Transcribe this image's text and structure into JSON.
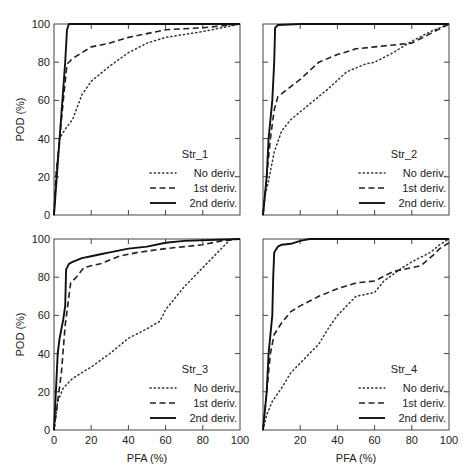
{
  "figure": {
    "ylabel": "POD (%)",
    "xlabel": "PFA (%)",
    "tick_labels": [
      "0",
      "20",
      "40",
      "60",
      "80",
      "100"
    ]
  },
  "legend": {
    "entries": [
      {
        "label": "No deriv.",
        "style": "dotted"
      },
      {
        "label": "1st deriv.",
        "style": "dashed"
      },
      {
        "label": "2nd deriv.",
        "style": "solid"
      }
    ]
  },
  "chart_data": [
    {
      "type": "line",
      "title": "Str_1",
      "xlabel": "",
      "ylabel": "POD (%)",
      "xlim": [
        0,
        100
      ],
      "ylim": [
        0,
        100
      ],
      "grid": false,
      "legend_position": "lower right",
      "series": [
        {
          "name": "No deriv.",
          "style": "dotted",
          "x": [
            0,
            1,
            3,
            6,
            10,
            15,
            20,
            30,
            40,
            50,
            60,
            80,
            100
          ],
          "y": [
            0,
            20,
            40,
            45,
            50,
            63,
            70,
            78,
            85,
            90,
            93,
            96,
            100
          ]
        },
        {
          "name": "1st deriv.",
          "style": "dashed",
          "x": [
            0,
            1,
            3,
            5,
            7,
            10,
            15,
            20,
            30,
            40,
            50,
            60,
            80,
            100
          ],
          "y": [
            0,
            20,
            40,
            60,
            79,
            82,
            85,
            88,
            90,
            93,
            95,
            97,
            98,
            100
          ]
        },
        {
          "name": "2nd deriv.",
          "style": "solid",
          "x": [
            0,
            6,
            7,
            8,
            100
          ],
          "y": [
            0,
            80,
            97,
            100,
            100
          ]
        }
      ]
    },
    {
      "type": "line",
      "title": "Str_2",
      "xlabel": "",
      "ylabel": "",
      "xlim": [
        0,
        100
      ],
      "ylim": [
        0,
        100
      ],
      "grid": false,
      "legend_position": "lower right",
      "series": [
        {
          "name": "No deriv.",
          "style": "dotted",
          "x": [
            0,
            1,
            3,
            6,
            10,
            15,
            25,
            35,
            45,
            55,
            60,
            70,
            75,
            80,
            90,
            100
          ],
          "y": [
            0,
            10,
            18,
            33,
            44,
            50,
            58,
            66,
            75,
            79,
            80,
            85,
            88,
            91,
            96,
            100
          ]
        },
        {
          "name": "1st deriv.",
          "style": "dashed",
          "x": [
            0,
            2,
            4,
            6,
            8,
            12,
            20,
            30,
            40,
            50,
            60,
            80,
            90,
            100
          ],
          "y": [
            0,
            20,
            40,
            55,
            62,
            65,
            71,
            80,
            84,
            87,
            88,
            90,
            95,
            100
          ]
        },
        {
          "name": "2nd deriv.",
          "style": "solid",
          "x": [
            0,
            2,
            3,
            5,
            6,
            6.5,
            8,
            20,
            100
          ],
          "y": [
            0,
            20,
            40,
            60,
            80,
            98,
            99.5,
            100,
            100
          ]
        }
      ]
    },
    {
      "type": "line",
      "title": "Str_3",
      "xlabel": "PFA (%)",
      "ylabel": "POD (%)",
      "xlim": [
        0,
        100
      ],
      "ylim": [
        0,
        100
      ],
      "grid": false,
      "legend_position": "lower right",
      "series": [
        {
          "name": "No deriv.",
          "style": "dotted",
          "x": [
            0,
            2,
            5,
            10,
            20,
            30,
            40,
            50,
            57,
            60,
            70,
            80,
            90,
            95,
            100
          ],
          "y": [
            0,
            15,
            22,
            27,
            33,
            40,
            48,
            53,
            57,
            63,
            75,
            85,
            95,
            100,
            100
          ]
        },
        {
          "name": "1st deriv.",
          "style": "dashed",
          "x": [
            0,
            2,
            4,
            6,
            7,
            8,
            9,
            12,
            16,
            20,
            25,
            35,
            45,
            60,
            80,
            90,
            100
          ],
          "y": [
            0,
            15,
            30,
            55,
            62,
            70,
            77,
            80,
            85,
            86,
            87,
            91,
            93,
            95,
            97,
            99,
            100
          ]
        },
        {
          "name": "2nd deriv.",
          "style": "solid",
          "x": [
            0,
            1,
            2,
            3,
            5,
            6,
            6.5,
            8,
            10,
            15,
            20,
            25,
            30,
            40,
            50,
            60,
            70,
            100
          ],
          "y": [
            0,
            20,
            40,
            48,
            58,
            65,
            84,
            87,
            88,
            90,
            91,
            92,
            93,
            95,
            96,
            98,
            99,
            100
          ]
        }
      ]
    },
    {
      "type": "line",
      "title": "Str_4",
      "xlabel": "PFA (%)",
      "ylabel": "",
      "xlim": [
        0,
        100
      ],
      "ylim": [
        0,
        100
      ],
      "grid": false,
      "legend_position": "lower right",
      "series": [
        {
          "name": "No deriv.",
          "style": "dotted",
          "x": [
            0,
            2,
            5,
            10,
            15,
            20,
            30,
            35,
            40,
            50,
            60,
            65,
            75,
            80,
            90,
            95,
            100
          ],
          "y": [
            0,
            8,
            15,
            22,
            30,
            35,
            45,
            53,
            60,
            70,
            72,
            78,
            85,
            88,
            93,
            97,
            100
          ]
        },
        {
          "name": "1st deriv.",
          "style": "dashed",
          "x": [
            0,
            2,
            4,
            6,
            10,
            15,
            20,
            30,
            40,
            50,
            60,
            70,
            80,
            85,
            92,
            95,
            100
          ],
          "y": [
            0,
            20,
            40,
            50,
            56,
            62,
            65,
            70,
            74,
            77,
            78,
            83,
            85,
            86,
            92,
            95,
            98
          ]
        },
        {
          "name": "2nd deriv.",
          "style": "solid",
          "x": [
            0,
            2,
            3,
            5,
            5.5,
            6,
            8,
            10,
            15,
            20,
            25,
            100
          ],
          "y": [
            0,
            20,
            40,
            60,
            80,
            93,
            96,
            97,
            97.5,
            99,
            100,
            100
          ]
        }
      ]
    }
  ]
}
